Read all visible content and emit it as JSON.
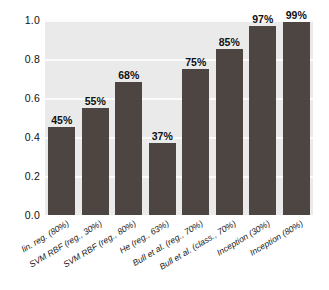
{
  "chart_data": {
    "type": "bar",
    "title": "",
    "subtitle": "",
    "xlabel": "",
    "ylabel": "",
    "ylim": [
      0.0,
      1.0
    ],
    "grid": true,
    "legend": "none",
    "orientation": "vertical",
    "bar_color": "#4d4541",
    "plot_background": "#eaeaea",
    "gridline_color": "#fbfbfb",
    "y_ticks": [
      "1.0",
      "0.8",
      "0.6",
      "0.4",
      "0.2",
      "0.0"
    ],
    "y_tick_values": [
      1.0,
      0.8,
      0.6,
      0.4,
      0.2,
      0.0
    ],
    "categories": [
      "lin. reg. (80%)",
      "SVM RBF (reg., 30%)",
      "SVM RBF (reg., 80%)",
      "He (reg., 63%)",
      "Bull et al. (reg., 70%)",
      "Bull et al. (class., 70%)",
      "Inception (30%)",
      "Inception (80%)"
    ],
    "values": [
      0.45,
      0.55,
      0.68,
      0.37,
      0.75,
      0.85,
      0.97,
      0.99
    ],
    "data_labels": [
      "45%",
      "55%",
      "68%",
      "37%",
      "75%",
      "85%",
      "97%",
      "99%"
    ]
  },
  "caption": {
    "cut_off_text": ""
  }
}
